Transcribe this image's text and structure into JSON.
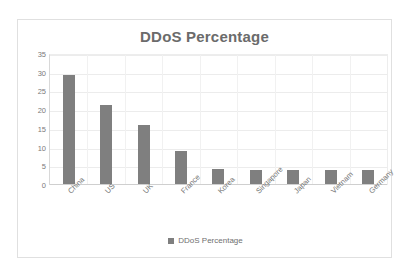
{
  "chart_data": {
    "type": "bar",
    "title": "DDoS Percentage",
    "xlabel": "",
    "ylabel": "",
    "ylim": [
      0,
      35
    ],
    "ytick_step": 5,
    "yticks": [
      35,
      30,
      25,
      20,
      15,
      10,
      5,
      0
    ],
    "grid": true,
    "legend_position": "bottom",
    "categories": [
      "China",
      "US",
      "UK",
      "France",
      "Korea",
      "Singapore",
      "Japan",
      "Vietnam",
      "Germany"
    ],
    "series": [
      {
        "name": "DDoS Percentage",
        "color": "#7f7f7f",
        "values": [
          29.5,
          21.5,
          16,
          9,
          4.2,
          4.1,
          4,
          4,
          3.9
        ]
      }
    ]
  },
  "legend": {
    "marker_name": "legend-color-swatch",
    "entries": [
      "DDoS Percentage"
    ]
  },
  "style": {
    "bar_color": "#7f7f7f",
    "title_color": "#6b6b6b",
    "tick_color": "#7a7a7a",
    "grid_color": "#ececec",
    "frame_border": "#e0e0e0",
    "plot_background": "#ffffff"
  }
}
